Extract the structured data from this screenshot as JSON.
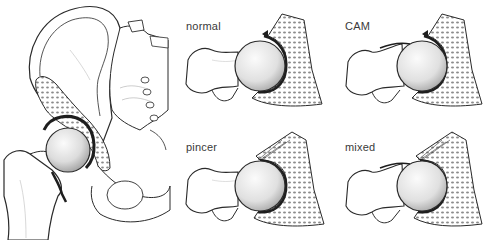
{
  "figure": {
    "overview": {
      "subject": "hip-joint-pelvis-anterior-view",
      "highlight": "femoral head in acetabulum with cancellous bone cross-section"
    },
    "panels": [
      {
        "id": "normal",
        "label": "normal",
        "impingement": "none"
      },
      {
        "id": "cam",
        "label": "CAM",
        "impingement": "femoral head-neck bump"
      },
      {
        "id": "pincer",
        "label": "pincer",
        "impingement": "acetabular over-coverage"
      },
      {
        "id": "mixed",
        "label": "mixed",
        "impingement": "cam and pincer combined"
      }
    ],
    "colors": {
      "line": "#2a2a2a",
      "bone_fill": "#ffffff",
      "cancellous": "#9a9a9a",
      "cartilage": "#1e1e1e",
      "head_light": "#f4f4f4",
      "head_shadow": "#b8b8b8",
      "label": "#3a3a3a"
    }
  }
}
